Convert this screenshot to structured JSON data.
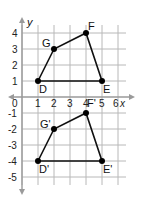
{
  "figure": {
    "axis_x_label": "x",
    "axis_y_label": "y",
    "origin_label": "0",
    "x_ticks": [
      "1",
      "2",
      "3",
      "4",
      "5",
      "6"
    ],
    "y_ticks_pos": [
      "1",
      "2",
      "3",
      "4"
    ],
    "y_ticks_neg": [
      "-1",
      "-2",
      "-3",
      "-4",
      "-5"
    ],
    "original": {
      "points": [
        {
          "name": "D",
          "x": 1,
          "y": 1
        },
        {
          "name": "G",
          "x": 2,
          "y": 3
        },
        {
          "name": "F",
          "x": 4,
          "y": 4
        },
        {
          "name": "E",
          "x": 5,
          "y": 1
        }
      ]
    },
    "image": {
      "points": [
        {
          "name": "D'",
          "x": 1,
          "y": -4
        },
        {
          "name": "G'",
          "x": 2,
          "y": -2
        },
        {
          "name": "F'",
          "x": 4,
          "y": -1
        },
        {
          "name": "E'",
          "x": 5,
          "y": -4
        }
      ]
    }
  }
}
